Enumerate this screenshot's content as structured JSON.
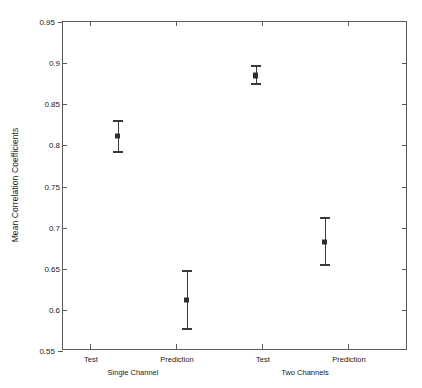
{
  "chart_data": {
    "type": "scatter",
    "title": "",
    "xlabel": "",
    "ylabel": "Mean Correlation Coefficients",
    "ylim": [
      0.55,
      0.95
    ],
    "yticks": [
      "0.55",
      "0.6",
      "0.65",
      "0.7",
      "0.75",
      "0.8",
      "0.85",
      "0.9",
      "0.95"
    ],
    "ytick_values": [
      0.55,
      0.6,
      0.65,
      0.7,
      0.75,
      0.8,
      0.85,
      0.9,
      0.95
    ],
    "categories": [
      "Test",
      "Prediction",
      "Test",
      "Prediction"
    ],
    "groups": [
      {
        "label": "Single Channel",
        "members": [
          0,
          1
        ]
      },
      {
        "label": "Two Channels",
        "members": [
          2,
          3
        ]
      }
    ],
    "grid": false,
    "legend": null,
    "series": [
      {
        "name": "Mean Correlation Coefficients",
        "values": [
          0.812,
          0.612,
          0.885,
          0.683
        ],
        "err_low": [
          0.791,
          0.575,
          0.874,
          0.653
        ],
        "err_high": [
          0.831,
          0.648,
          0.898,
          0.713
        ],
        "marker": "square",
        "color": "#2e2e2e"
      }
    ],
    "points": [
      {
        "x_label": "Test",
        "group": "Single Channel",
        "mean": 0.812,
        "lower": 0.791,
        "upper": 0.831
      },
      {
        "x_label": "Prediction",
        "group": "Single Channel",
        "mean": 0.612,
        "lower": 0.575,
        "upper": 0.648
      },
      {
        "x_label": "Test",
        "group": "Two Channels",
        "mean": 0.885,
        "lower": 0.874,
        "upper": 0.898
      },
      {
        "x_label": "Prediction",
        "group": "Two Channels",
        "mean": 0.683,
        "lower": 0.653,
        "upper": 0.713
      }
    ]
  },
  "axis": {
    "ytick_labels": [
      "0.95",
      "0.9",
      "0.85",
      "0.8",
      "0.75",
      "0.7",
      "0.65",
      "0.6",
      "0.55"
    ],
    "xtick_labels": [
      "Test",
      "Prediction",
      "Test",
      "Prediction"
    ],
    "group_labels": [
      "Single Channel",
      "Two Channels"
    ],
    "ylabel": "Mean Correlation Coefficients"
  },
  "colors": {
    "axis": "#5a5a5a",
    "marker": "#2e2e2e",
    "error_bar": "#3a3a3a",
    "background": "#ffffff",
    "text": "#1a1a1a"
  }
}
